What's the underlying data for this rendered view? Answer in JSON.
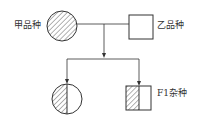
{
  "diagram": {
    "parents": {
      "female": {
        "label": "甲品种",
        "shape": "circle",
        "fill": "hatched"
      },
      "male": {
        "label": "乙品种",
        "shape": "square",
        "fill": "empty"
      }
    },
    "offspring": {
      "left": {
        "label": "",
        "shape": "circle",
        "fill": "half-hatched-left"
      },
      "right": {
        "label": "F1杂种",
        "shape": "square",
        "fill": "half-hatched-left"
      }
    },
    "colors": {
      "stroke": "#333333",
      "background": "#ffffff"
    }
  }
}
